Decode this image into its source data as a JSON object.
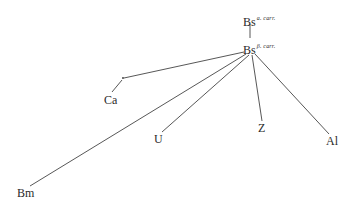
{
  "diagram": {
    "type": "stemma",
    "nodes": [
      {
        "id": "bs_a",
        "label": "Bs",
        "superscript": "a. carr.",
        "x": 250,
        "y": 18
      },
      {
        "id": "bs_b",
        "label": "Bs",
        "superscript": "β. carr.",
        "x": 250,
        "y": 47
      },
      {
        "id": "hyp",
        "label": "",
        "x": 123,
        "y": 78
      },
      {
        "id": "ca",
        "label": "Ca",
        "x": 112,
        "y": 100
      },
      {
        "id": "u",
        "label": "U",
        "x": 159,
        "y": 139
      },
      {
        "id": "z",
        "label": "Z",
        "x": 262,
        "y": 128
      },
      {
        "id": "al",
        "label": "Al",
        "x": 332,
        "y": 141
      },
      {
        "id": "bm",
        "label": "Bm",
        "x": 25,
        "y": 193
      }
    ],
    "edges": [
      {
        "from": "bs_a",
        "to": "bs_b"
      },
      {
        "from": "bs_b",
        "to": "hyp"
      },
      {
        "from": "hyp",
        "to": "ca"
      },
      {
        "from": "bs_b",
        "to": "bm"
      },
      {
        "from": "bs_b",
        "to": "u"
      },
      {
        "from": "bs_b",
        "to": "z"
      },
      {
        "from": "bs_b",
        "to": "al"
      }
    ]
  },
  "labels": {
    "bs_a": "Bs",
    "bs_a_sup": "a. carr.",
    "bs_b": "Bs",
    "bs_b_sup": "β. carr.",
    "ca": "Ca",
    "u": "U",
    "z": "Z",
    "al": "Al",
    "bm": "Bm"
  }
}
